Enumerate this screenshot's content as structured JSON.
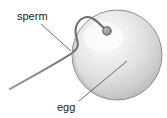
{
  "diagram": {
    "background_color": "#ffffff",
    "labels": {
      "sperm": "sperm",
      "egg": "egg"
    },
    "label_positions": {
      "sperm": {
        "x": 17,
        "y": 20
      },
      "egg": {
        "x": 57,
        "y": 111
      }
    },
    "colors": {
      "label_text": "#1a1a1a",
      "leader_line": "#5a5a5a",
      "egg_outline": "#8e8e8e",
      "egg_fill_highlight": "#fbfbfb",
      "egg_fill_mid": "#dcdcdc",
      "egg_fill_shadow": "#b2b2b2",
      "sperm_tail": "#6f6f6f",
      "sperm_head_fill": "#9a9a9a",
      "sperm_head_outline": "#5c5c5c"
    },
    "egg": {
      "shape": "sphere",
      "center_x": 117,
      "center_y": 55,
      "radius": 45,
      "highlight_x": 103,
      "highlight_y": 38
    },
    "sperm": {
      "head_x": 107,
      "head_y": 31,
      "head_radius": 4.2,
      "tail_path": "M107,31 C101,26 94,16 87,17 C79,18 74,26 76,35 C78,44 80,47 72,53 C64,59 44,70 10,89"
    },
    "leader_lines": {
      "sperm": {
        "x1": 41,
        "y1": 24,
        "x2": 71,
        "y2": 51
      },
      "egg": {
        "x1": 79,
        "y1": 101,
        "x2": 127,
        "y2": 61
      }
    }
  }
}
